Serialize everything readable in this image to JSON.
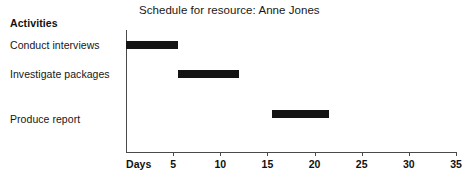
{
  "chart_data": {
    "type": "bar",
    "orientation": "horizontal",
    "subtype": "gantt",
    "title": "Schedule for resource: Anne Jones",
    "xlabel": "Days",
    "ylabel": "Activities",
    "categories": [
      "Conduct interviews",
      "Investigate packages",
      "Produce report"
    ],
    "series": [
      {
        "name": "Schedule",
        "bars": [
          {
            "label": "Conduct interviews",
            "start": 0,
            "end": 5.5,
            "duration": 5.5
          },
          {
            "label": "Investigate packages",
            "start": 5.5,
            "end": 12,
            "duration": 6.5
          },
          {
            "label": "Produce report",
            "start": 15.5,
            "end": 21.5,
            "duration": 6
          }
        ]
      }
    ],
    "xlim": [
      0,
      35
    ],
    "xticks": [
      5,
      10,
      15,
      20,
      25,
      30,
      35
    ],
    "xtick_labels": [
      "5",
      "10",
      "15",
      "20",
      "25",
      "30",
      "35"
    ],
    "grid": false,
    "legend": null,
    "bar_color": "#141414",
    "axis_color": "#4a4a4a"
  },
  "header": {
    "activities_label": "Activities"
  },
  "axis": {
    "days_label": "Days"
  }
}
